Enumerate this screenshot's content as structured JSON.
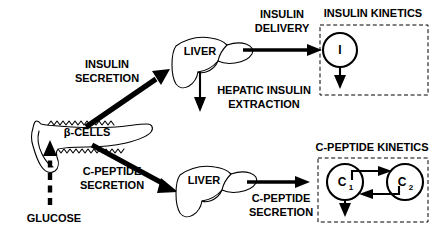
{
  "diagram": {
    "nodes": {
      "beta_cells": "β-CELLS",
      "glucose": "GLUCOSE",
      "liver_top": "LIVER",
      "liver_bottom": "LIVER",
      "insulin_compartment": "I",
      "cpeptide_compartment_1": "C",
      "cpeptide_compartment_1_sub": "1",
      "cpeptide_compartment_2": "C",
      "cpeptide_compartment_2_sub": "2"
    },
    "flow_labels": {
      "insulin_secretion_line1": "INSULIN",
      "insulin_secretion_line2": "SECRETION",
      "insulin_delivery_line1": "INSULIN",
      "insulin_delivery_line2": "DELIVERY",
      "hepatic_extraction_line1": "HEPATIC INSULIN",
      "hepatic_extraction_line2": "EXTRACTION",
      "cpeptide_secretion_left_line1": "C-PEPTIDE",
      "cpeptide_secretion_left_line2": "SECRETION",
      "cpeptide_secretion_right_line1": "C-PEPTIDE",
      "cpeptide_secretion_right_line2": "SECRETION"
    },
    "box_titles": {
      "insulin_kinetics": "INSULIN KINETICS",
      "cpeptide_kinetics": "C-PEPTIDE KINETICS"
    },
    "colors": {
      "ink": "#000000",
      "background": "#ffffff"
    }
  }
}
